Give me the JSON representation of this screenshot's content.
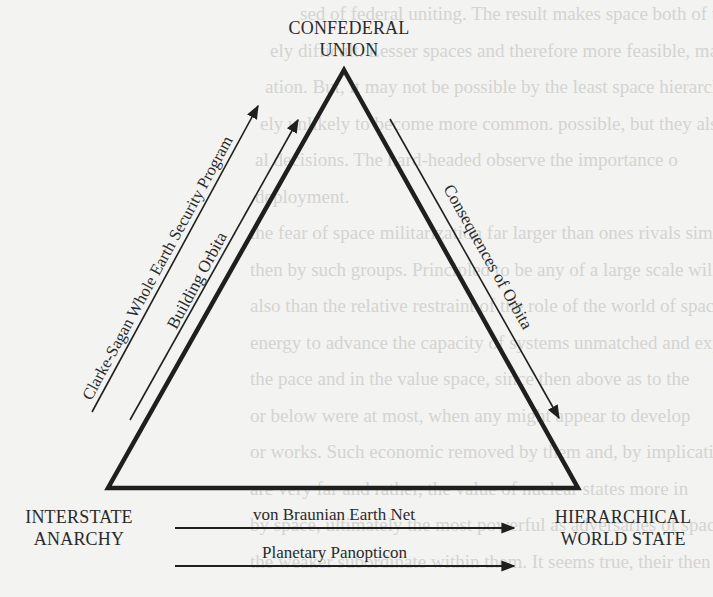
{
  "diagram": {
    "type": "triangle-transition-diagram",
    "nodes": {
      "top": {
        "lines": [
          "CONFEDERAL",
          "UNION"
        ]
      },
      "bottom_left": {
        "lines": [
          "INTERSTATE",
          "ANARCHY"
        ]
      },
      "bottom_right": {
        "lines": [
          "HIERARCHICAL",
          "WORLD STATE"
        ]
      }
    },
    "edges": [
      {
        "id": "clarke-sagan",
        "label": "Clarke-Sagan Whole Earth Security Program",
        "from": "INTERSTATE ANARCHY",
        "to": "CONFEDERAL UNION"
      },
      {
        "id": "building-orbita",
        "label": "Building Orbita",
        "from": "INTERSTATE ANARCHY",
        "to": "CONFEDERAL UNION"
      },
      {
        "id": "consequences-orbita",
        "label": "Consequences of Orbita",
        "from": "CONFEDERAL UNION",
        "to": "HIERARCHICAL WORLD STATE"
      },
      {
        "id": "von-braunian",
        "label": "von Braunian Earth Net",
        "from": "INTERSTATE ANARCHY",
        "to": "HIERARCHICAL WORLD STATE"
      },
      {
        "id": "planetary-panopticon",
        "label": "Planetary Panopticon",
        "from": "INTERSTATE ANARCHY",
        "to": "HIERARCHICAL WORLD STATE"
      }
    ],
    "colors": {
      "ink": "#1f1f1f",
      "paper": "#f3f3f1",
      "bleed_through": "#d4d4d2"
    }
  },
  "background_bleed_through": [
    "sed of federal uniting. The result makes space both of the least",
    "ely difficult. Lesser spaces and therefore more feasible, may be app",
    "ation. But, it may not be possible by the least space hierarchy",
    "ely unlikely to become more common. possible, but they also are",
    "al decisions. The hard-headed observe the importance o",
    "deployment.",
    "the fear of space militarization far larger than ones rivals simply",
    "then by such groups. Principled to be any of a large scale will",
    "also than the relative restraint of the role of the world of space",
    "energy to advance the capacity of systems unmatched and expansion",
    "the pace and in the value space, since then above as to the",
    "or below were at most, when any might appear to develop",
    "or works. Such economic removed by them and, by implication, the",
    "are very far and rather, the value of nuclear states more in",
    "by space, ultimately the most powerful as adversaries of space",
    "the weaker subordinate within them. It seems true, their then"
  ]
}
